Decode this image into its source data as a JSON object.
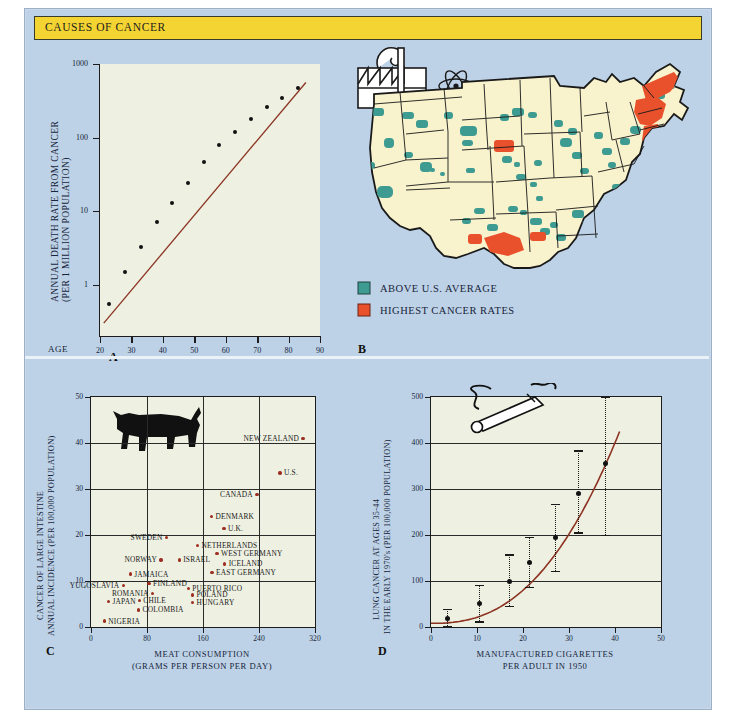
{
  "header": {
    "title": "CAUSES OF CANCER",
    "bar_color": "#f4d432"
  },
  "palette": {
    "plate_bg": "#bdd2e6",
    "plot_bg": "#eef0e2",
    "land": "#f8f2cd",
    "teal": "#3d9b92",
    "orange": "#e8512c",
    "curve_red": "#8c3322",
    "ink": "#17243b"
  },
  "panels": {
    "a": {
      "letter": "A",
      "age_word": "AGE"
    },
    "b": {
      "letter": "B"
    },
    "c": {
      "letter": "C"
    },
    "d": {
      "letter": "D"
    }
  },
  "map": {
    "icons": [
      "smokestack-factory-icon",
      "atom-icon"
    ],
    "legend": [
      {
        "label": "ABOVE U.S. AVERAGE",
        "color": "#3d9b92"
      },
      {
        "label": "HIGHEST CANCER RATES",
        "color": "#e8512c"
      }
    ]
  },
  "chart_data": [
    {
      "id": "A",
      "type": "line",
      "title": "",
      "xlabel": "AGE",
      "ylabel": "ANNUAL DEATH RATE FROM CANCER (PER 1 MILLION POPULATION)",
      "ylabel_line1": "ANNUAL DEATH RATE FROM CANCER",
      "ylabel_line2": "(PER 1 MILLION POPULATION)",
      "yscale": "log",
      "ylim": [
        0.2,
        1000
      ],
      "yticks": [
        1,
        10,
        100,
        1000
      ],
      "ytick_labels": [
        "1",
        "10",
        "100",
        "1000"
      ],
      "xlim": [
        20,
        90
      ],
      "xticks": [
        20,
        30,
        40,
        50,
        60,
        70,
        80,
        90
      ],
      "xtick_labels": [
        "20",
        "30",
        "40",
        "50",
        "60",
        "70",
        "80",
        "90"
      ],
      "grid": false,
      "x": [
        23,
        28,
        33,
        38,
        43,
        48,
        53,
        58,
        63,
        68,
        73,
        78,
        83
      ],
      "y": [
        0.55,
        1.5,
        3.2,
        7.0,
        13.0,
        24.0,
        46.0,
        80.0,
        120.0,
        180.0,
        260.0,
        350.0,
        470.0
      ]
    },
    {
      "id": "C",
      "type": "scatter",
      "title": "",
      "xlabel": "MEAT CONSUMPTION",
      "xlabel_line2": "(GRAMS PER PERSON PER DAY)",
      "ylabel_line1": "CANCER OF LARGE INTESTINE",
      "ylabel_line2": "ANNUAL INCIDENCE (PER 100,000 POPULATION)",
      "xlim": [
        0,
        320
      ],
      "ylim": [
        0,
        50
      ],
      "xticks": [
        0,
        80,
        160,
        240,
        320
      ],
      "xtick_labels": [
        "0",
        "80",
        "160",
        "240",
        "320"
      ],
      "yticks": [
        0,
        10,
        20,
        30,
        40,
        50
      ],
      "ytick_labels": [
        "0",
        "10",
        "20",
        "30",
        "40",
        "50"
      ],
      "grid": true,
      "points": [
        {
          "label": "NEW ZEALAND",
          "x": 303,
          "y": 41.0,
          "side": "left"
        },
        {
          "label": "U.S.",
          "x": 270,
          "y": 33.5,
          "side": "right"
        },
        {
          "label": "CANADA",
          "x": 237,
          "y": 28.8,
          "side": "left"
        },
        {
          "label": "DENMARK",
          "x": 172,
          "y": 24.0,
          "side": "right"
        },
        {
          "label": "U.K.",
          "x": 190,
          "y": 21.4,
          "side": "right"
        },
        {
          "label": "SWEDEN",
          "x": 108,
          "y": 19.5,
          "side": "left"
        },
        {
          "label": "NETHERLANDS",
          "x": 152,
          "y": 17.7,
          "side": "right"
        },
        {
          "label": "WEST GERMANY",
          "x": 180,
          "y": 16.0,
          "side": "right"
        },
        {
          "label": "ISRAEL",
          "x": 126,
          "y": 14.6,
          "side": "right"
        },
        {
          "label": "NORWAY",
          "x": 100,
          "y": 14.6,
          "side": "left"
        },
        {
          "label": "ICELAND",
          "x": 191,
          "y": 13.7,
          "side": "right"
        },
        {
          "label": "EAST GERMANY",
          "x": 173,
          "y": 11.9,
          "side": "right"
        },
        {
          "label": "JAMAICA",
          "x": 56,
          "y": 11.5,
          "side": "right"
        },
        {
          "label": "FINLAND",
          "x": 83,
          "y": 9.4,
          "side": "right"
        },
        {
          "label": "YUGOSLAVIA",
          "x": 46,
          "y": 9.0,
          "side": "left"
        },
        {
          "label": "PUERTO RICO",
          "x": 139,
          "y": 8.4,
          "side": "right"
        },
        {
          "label": "ROMANIA",
          "x": 88,
          "y": 7.3,
          "side": "left"
        },
        {
          "label": "POLAND",
          "x": 145,
          "y": 7.0,
          "side": "right"
        },
        {
          "label": "CHILE",
          "x": 69,
          "y": 5.8,
          "side": "right"
        },
        {
          "label": "JAPAN",
          "x": 25,
          "y": 5.6,
          "side": "right"
        },
        {
          "label": "HUNGARY",
          "x": 145,
          "y": 5.3,
          "side": "right"
        },
        {
          "label": "COLOMBIA",
          "x": 68,
          "y": 3.7,
          "side": "right"
        },
        {
          "label": "NIGERIA",
          "x": 19,
          "y": 1.3,
          "side": "right"
        }
      ]
    },
    {
      "id": "D",
      "type": "scatter",
      "title": "",
      "xlabel": "MANUFACTURED CIGARETTES",
      "xlabel_line2": "PER ADULT IN 1950",
      "ylabel_line1": "LUNG CANCER AT AGES 35-44",
      "ylabel_line2": "IN THE EARLY 1970's (PER 100,000 POPULATION)",
      "xlim": [
        0,
        50
      ],
      "ylim": [
        0,
        500
      ],
      "xticks": [
        0,
        10,
        20,
        30,
        40,
        50
      ],
      "xtick_labels": [
        "0",
        "10",
        "20",
        "30",
        "40",
        "50"
      ],
      "yticks": [
        0,
        100,
        200,
        300,
        400,
        500
      ],
      "ytick_labels": [
        "0",
        "100",
        "200",
        "300",
        "400",
        "500"
      ],
      "grid": true,
      "points": [
        {
          "x": 3.5,
          "y": 18,
          "lo": 2,
          "hi": 40
        },
        {
          "x": 10.5,
          "y": 52,
          "lo": 12,
          "hi": 92
        },
        {
          "x": 17.0,
          "y": 100,
          "lo": 46,
          "hi": 158
        },
        {
          "x": 21.5,
          "y": 140,
          "lo": 88,
          "hi": 196
        },
        {
          "x": 27.0,
          "y": 195,
          "lo": 122,
          "hi": 268
        },
        {
          "x": 32.0,
          "y": 290,
          "lo": 206,
          "hi": 384
        },
        {
          "x": 38.0,
          "y": 355,
          "lo": 200,
          "hi": 500
        }
      ],
      "fit_curve": {
        "x0": 0,
        "x1": 41,
        "y0": 8,
        "y1": 425,
        "note": "fitted power curve"
      }
    }
  ]
}
